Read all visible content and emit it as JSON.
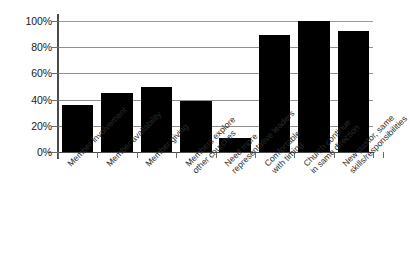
{
  "chart_data": {
    "type": "bar",
    "title": "",
    "xlabel": "",
    "ylabel": "",
    "ylim": [
      0,
      100
    ],
    "yticks": [
      "0%",
      "20%",
      "40%",
      "60%",
      "80%",
      "100%"
    ],
    "ytick_values": [
      0,
      20,
      40,
      60,
      80,
      100
    ],
    "grid": true,
    "legend": "none",
    "orientation": "vertical",
    "bar_color": "#000000",
    "gridline_color": "#8f8f8f",
    "axis_color": "#4a4a4a",
    "categories": [
      "Member involvement",
      "Member availability",
      "Member giving",
      "Members explore other churches",
      "Need more representative leaders",
      "Comfortable with timing",
      "Church continue in same direction",
      "New pastor, same skills/responsibilities"
    ],
    "category_lines": [
      [
        "Member involvement"
      ],
      [
        "Member availability"
      ],
      [
        "Member giving"
      ],
      [
        "Members explore",
        "other churches"
      ],
      [
        "Need more",
        "representative leaders"
      ],
      [
        "Comfortable",
        "with timing"
      ],
      [
        "Church continue",
        "in same direction"
      ],
      [
        "New pastor, same",
        "skills/responsibilities"
      ]
    ],
    "values": [
      36,
      45,
      50,
      39,
      11,
      89,
      100,
      92
    ]
  }
}
